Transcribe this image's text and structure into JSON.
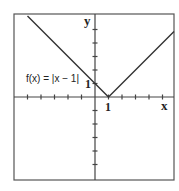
{
  "chart_data": {
    "type": "line",
    "title": "",
    "function_label": "f(x) = |x − 1|",
    "xlabel": "x",
    "ylabel": "y",
    "xlim": [
      -6,
      6
    ],
    "ylim": [
      -6,
      6
    ],
    "grid": false,
    "frame": true,
    "ticks": {
      "x": [
        -5,
        -4,
        -3,
        -2,
        -1,
        1,
        2,
        3,
        4,
        5
      ],
      "y": [
        -5,
        -4,
        -3,
        -2,
        -1,
        1,
        2,
        3,
        4,
        5
      ]
    },
    "tick_labels": {
      "x": [
        {
          "value": 1,
          "label": "1"
        }
      ],
      "y": [
        {
          "value": 1,
          "label": "1"
        }
      ]
    },
    "series": [
      {
        "name": "f(x) = |x − 1|",
        "x": [
          -5,
          1,
          6
        ],
        "y": [
          6,
          0,
          5
        ]
      }
    ],
    "colors": {
      "line": "#333333",
      "axis": "#444444",
      "frame": "#555555"
    }
  }
}
